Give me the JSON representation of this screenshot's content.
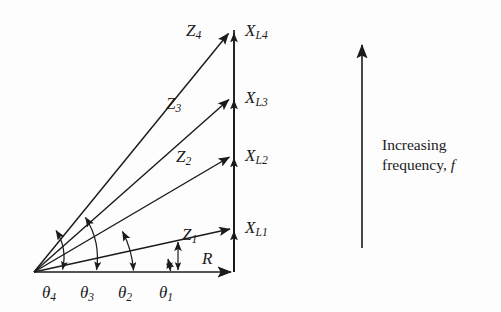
{
  "figure": {
    "background_color": "#fdfdfd",
    "stroke_color": "#1b1b1b",
    "origin": {
      "x": 34,
      "y": 272
    },
    "axis_x_end": {
      "x": 234,
      "y": 272
    },
    "vertical_axis": {
      "x": 234,
      "top_y": 30,
      "bottom_y": 272
    }
  },
  "labels": {
    "resistance": {
      "symbol": "R",
      "subscript": ""
    },
    "impedances": [
      {
        "symbol": "Z",
        "subscript": "1",
        "tip_x": 234,
        "tip_y": 228,
        "label_x": 182,
        "label_y": 226
      },
      {
        "symbol": "Z",
        "subscript": "2",
        "tip_x": 234,
        "tip_y": 155,
        "label_x": 176,
        "label_y": 148
      },
      {
        "symbol": "Z",
        "subscript": "3",
        "tip_x": 234,
        "tip_y": 97,
        "label_x": 166,
        "label_y": 95
      },
      {
        "symbol": "Z",
        "subscript": "4",
        "tip_x": 234,
        "tip_y": 30,
        "label_x": 186,
        "label_y": 22
      }
    ],
    "reactances": [
      {
        "symbol": "X",
        "subscript": "L1",
        "label_x": 245,
        "label_y": 219
      },
      {
        "symbol": "X",
        "subscript": "L2",
        "label_x": 245,
        "label_y": 147
      },
      {
        "symbol": "X",
        "subscript": "L3",
        "label_x": 245,
        "label_y": 89
      },
      {
        "symbol": "X",
        "subscript": "L4",
        "label_x": 245,
        "label_y": 22
      }
    ],
    "angles": [
      {
        "symbol": "θ",
        "subscript": "1",
        "label_x": 159,
        "label_y": 284
      },
      {
        "symbol": "θ",
        "subscript": "2",
        "label_x": 118,
        "label_y": 284
      },
      {
        "symbol": "θ",
        "subscript": "3",
        "label_x": 80,
        "label_y": 284
      },
      {
        "symbol": "θ",
        "subscript": "4",
        "label_x": 42,
        "label_y": 284
      }
    ]
  },
  "frequency_annotation": {
    "line1": "Increasing",
    "line2_prefix": "frequency",
    "line2_comma": ",",
    "line2_symbol": "f",
    "arrow": {
      "x": 362,
      "top_y": 42,
      "bottom_y": 248
    },
    "text_x": 382,
    "text_y": 135
  },
  "colors": {
    "ink": "#1b1b1b",
    "background": "#fdfdfd"
  }
}
